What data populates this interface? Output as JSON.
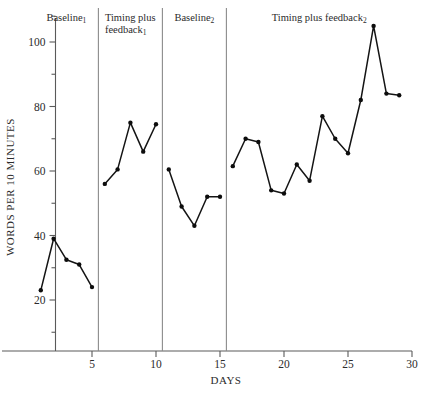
{
  "chart_data": {
    "type": "line",
    "title": "",
    "xlabel": "DAYS",
    "ylabel": "WORDS PER 10 MINUTES",
    "xlim": [
      0,
      30.5
    ],
    "ylim": [
      10,
      108
    ],
    "xticks": [
      5,
      10,
      15,
      20,
      25,
      30
    ],
    "yticks": [
      20,
      40,
      60,
      80,
      100
    ],
    "yminorticks": [
      10,
      30,
      50,
      70,
      90
    ],
    "grid": false,
    "legend": null,
    "line_color": "#141414",
    "marker_color": "#0d0d0d",
    "axis_color": "#5a5a5a",
    "divider_color": "#8c8c8c",
    "phase_dividers": [
      5.5,
      10.5,
      15.5
    ],
    "series": [
      {
        "name": "Baseline 1",
        "x": [
          1,
          2,
          3,
          4,
          5
        ],
        "values": [
          23,
          39,
          32.5,
          31,
          24
        ]
      },
      {
        "name": "Timing plus feedback 1",
        "x": [
          6,
          7,
          8,
          9,
          10
        ],
        "values": [
          56,
          60.5,
          75,
          66,
          74.5
        ]
      },
      {
        "name": "Baseline 2",
        "x": [
          11,
          12,
          13,
          14,
          15
        ],
        "values": [
          60.5,
          49,
          43,
          52,
          52
        ]
      },
      {
        "name": "Timing plus feedback 2",
        "x": [
          16,
          17,
          18,
          19,
          20,
          21,
          22,
          23,
          24,
          25,
          26,
          27,
          28,
          29
        ],
        "values": [
          61.5,
          70,
          69,
          54,
          53,
          62,
          57,
          77,
          70,
          65.5,
          82,
          105,
          84,
          83.5
        ]
      }
    ]
  },
  "phases": [
    {
      "name": "baseline-1",
      "label_main": "Baseline",
      "label_sub": "1",
      "line2_main": "",
      "line2_sub": ""
    },
    {
      "name": "timing-plus-feedback-1",
      "label_main": "Timing plus",
      "label_sub": "",
      "line2_main": "feedback",
      "line2_sub": "1"
    },
    {
      "name": "baseline-2",
      "label_main": "Baseline",
      "label_sub": "2",
      "line2_main": "",
      "line2_sub": ""
    },
    {
      "name": "timing-plus-feedback-2",
      "label_main": "Timing plus feedback",
      "label_sub": "2",
      "line2_main": "",
      "line2_sub": ""
    }
  ]
}
